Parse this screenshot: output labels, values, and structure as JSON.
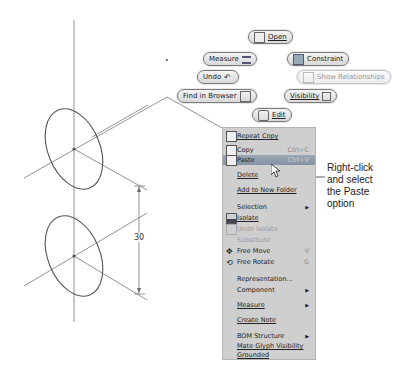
{
  "marking_menu": {
    "open": "Open",
    "measure": "Measure",
    "constraint": "Constraint",
    "undo": "Undo",
    "show_relationships": "Show Relationships",
    "find_in_browser": "Find in Browser",
    "visibility": "Visibility",
    "edit": "Edit"
  },
  "context_menu": {
    "items": [
      {
        "label": "Repeat Copy",
        "icon": "repeat-copy-icon"
      },
      {
        "label": "Copy",
        "shortcut": "Ctrl+C",
        "icon": "copy-icon"
      },
      {
        "label": "Paste",
        "shortcut": "Ctrl+V",
        "icon": "paste-icon",
        "highlighted": true
      },
      {
        "label": "Delete"
      },
      {
        "label": "Add to New Folder"
      },
      {
        "label": "Selection",
        "submenu": true
      },
      {
        "label": "Isolate",
        "icon": "isolate-icon"
      },
      {
        "label": "Undo Isolate",
        "icon": "undo-isolate-icon",
        "disabled": true
      },
      {
        "label": "Substitute",
        "disabled": true
      },
      {
        "label": "Free Move",
        "shortcut": "V",
        "icon": "free-move-icon"
      },
      {
        "label": "Free Rotate",
        "shortcut": "G",
        "icon": "free-rotate-icon"
      },
      {
        "label": "Representation..."
      },
      {
        "label": "Component",
        "submenu": true
      },
      {
        "label": "Measure",
        "submenu": true
      },
      {
        "label": "Create Note"
      },
      {
        "label": "BOM Structure",
        "submenu": true
      },
      {
        "label": "Mate Glyph Visibility"
      },
      {
        "label": "Grounded"
      }
    ],
    "submenu_arrow": "▶"
  },
  "drawing": {
    "dimension_label": "30"
  },
  "callout": {
    "line1": "Right-click",
    "line2": "and select",
    "line3": "the Paste",
    "line4": "option"
  }
}
